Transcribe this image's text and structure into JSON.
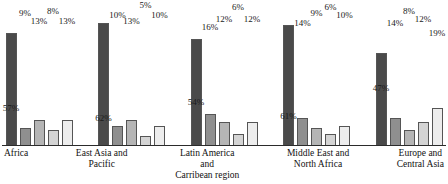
{
  "chart_data": {
    "type": "bar",
    "title": "",
    "xlabel": "",
    "ylabel": "",
    "ylim": [
      0,
      65
    ],
    "grid": false,
    "legend": "none",
    "value_suffix": "%",
    "categories": [
      "Africa",
      "East Asia and\nPacific",
      "Latin America\nand\nCarribean region",
      "Middle East and\nNorth Africa",
      "Europe and\nCentral Asia"
    ],
    "series": [
      {
        "name": "series-1",
        "shade": "#4a4a4a",
        "values": [
          57,
          62,
          54,
          61,
          47
        ]
      },
      {
        "name": "series-2",
        "shade": "#8f8f8f",
        "values": [
          9,
          10,
          16,
          14,
          14
        ]
      },
      {
        "name": "series-3",
        "shade": "#b5b5b5",
        "values": [
          13,
          13,
          12,
          9,
          8
        ]
      },
      {
        "name": "series-4",
        "shade": "#d4d4d4",
        "values": [
          8,
          5,
          6,
          6,
          12
        ]
      },
      {
        "name": "series-5",
        "shade": "#ededed",
        "values": [
          13,
          10,
          12,
          10,
          19
        ]
      }
    ],
    "groups": [
      {
        "label_lines": [
          "Africa"
        ],
        "bars": [
          {
            "value": 57,
            "label": "57%",
            "shade": "#4a4a4a"
          },
          {
            "value": 9,
            "label": "9%",
            "shade": "#8f8f8f"
          },
          {
            "value": 13,
            "label": "13%",
            "shade": "#b5b5b5"
          },
          {
            "value": 8,
            "label": "8%",
            "shade": "#d4d4d4"
          },
          {
            "value": 13,
            "label": "13%",
            "shade": "#ededed"
          }
        ]
      },
      {
        "label_lines": [
          "East Asia and",
          "Pacific"
        ],
        "bars": [
          {
            "value": 62,
            "label": "62%",
            "shade": "#4a4a4a"
          },
          {
            "value": 10,
            "label": "10%",
            "shade": "#8f8f8f"
          },
          {
            "value": 13,
            "label": "13%",
            "shade": "#b5b5b5"
          },
          {
            "value": 5,
            "label": "5%",
            "shade": "#d4d4d4"
          },
          {
            "value": 10,
            "label": "10%",
            "shade": "#ededed"
          }
        ]
      },
      {
        "label_lines": [
          "Latin America",
          "and",
          "Carribean region"
        ],
        "bars": [
          {
            "value": 54,
            "label": "54%",
            "shade": "#4a4a4a"
          },
          {
            "value": 16,
            "label": "16%",
            "shade": "#8f8f8f"
          },
          {
            "value": 12,
            "label": "12%",
            "shade": "#b5b5b5"
          },
          {
            "value": 6,
            "label": "6%",
            "shade": "#d4d4d4"
          },
          {
            "value": 12,
            "label": "12%",
            "shade": "#ededed"
          }
        ]
      },
      {
        "label_lines": [
          "Middle East and",
          "North Africa"
        ],
        "bars": [
          {
            "value": 61,
            "label": "61%",
            "shade": "#4a4a4a"
          },
          {
            "value": 14,
            "label": "14%",
            "shade": "#8f8f8f"
          },
          {
            "value": 9,
            "label": "9%",
            "shade": "#b5b5b5"
          },
          {
            "value": 6,
            "label": "6%",
            "shade": "#d4d4d4"
          },
          {
            "value": 10,
            "label": "10%",
            "shade": "#ededed"
          }
        ]
      },
      {
        "label_lines": [
          "Europe and",
          "Central Asia"
        ],
        "bars": [
          {
            "value": 47,
            "label": "47%",
            "shade": "#4a4a4a"
          },
          {
            "value": 14,
            "label": "14%",
            "shade": "#8f8f8f"
          },
          {
            "value": 8,
            "label": "8%",
            "shade": "#b5b5b5"
          },
          {
            "value": 12,
            "label": "12%",
            "shade": "#d4d4d4"
          },
          {
            "value": 19,
            "label": "19%",
            "shade": "#ededed"
          }
        ]
      }
    ]
  },
  "axis": {
    "baseline_color": "#2b2b2b"
  }
}
